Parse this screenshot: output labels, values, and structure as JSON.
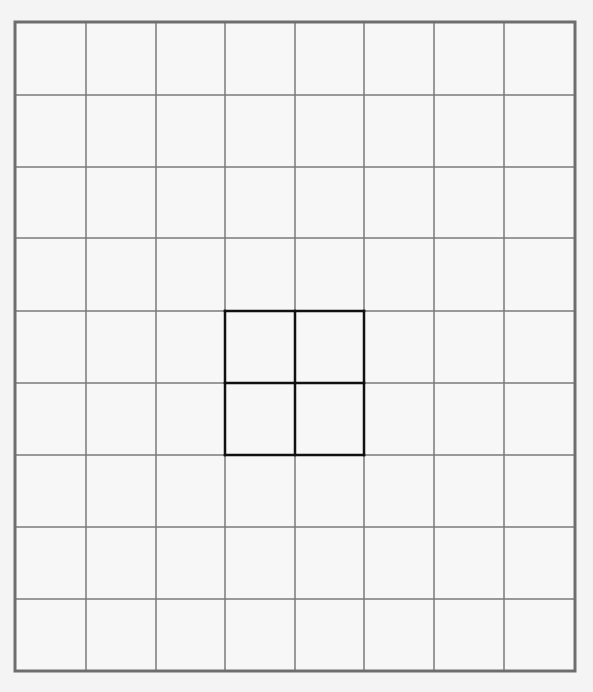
{
  "grid": {
    "columns": 8,
    "rows": 9,
    "x_lines": [
      15,
      86,
      156,
      225,
      295,
      364,
      434,
      504,
      575
    ],
    "y_lines": [
      22,
      95,
      167,
      238,
      311,
      383,
      455,
      527,
      599,
      671
    ],
    "line_color": "#7a7a7a",
    "border_color": "#6e6e6e",
    "cell_fill": "#f7f7f7",
    "background": "#f4f4f4"
  },
  "highlight": {
    "col_start": 3,
    "col_end": 5,
    "row_start": 4,
    "row_end": 6,
    "color": "#111111",
    "description": "bold 2x2 block of cells"
  }
}
